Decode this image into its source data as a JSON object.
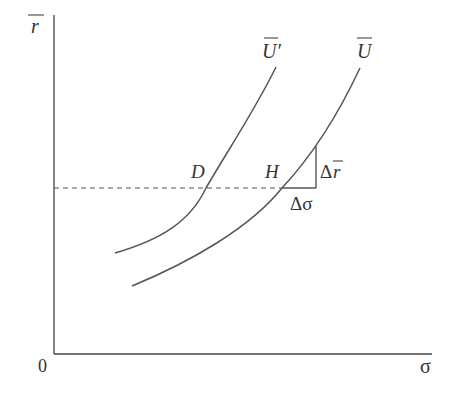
{
  "diagram": {
    "type": "indifference-curves",
    "axes": {
      "y_label": "r",
      "y_label_overbar": true,
      "x_label": "σ",
      "origin_label": "0"
    },
    "curves": [
      {
        "name": "U'",
        "label": "U′",
        "overbar": true
      },
      {
        "name": "U",
        "label": "U",
        "overbar": true
      }
    ],
    "points": [
      {
        "name": "D",
        "label": "D"
      },
      {
        "name": "H",
        "label": "H"
      }
    ],
    "triangle": {
      "horizontal_label": "Δσ",
      "vertical_label_prefix": "Δ",
      "vertical_label_var": "r",
      "vertical_overbar": true
    },
    "colors": {
      "axis": "#444444",
      "curve": "#555555",
      "dashed": "#555555",
      "text": "#333333"
    }
  }
}
